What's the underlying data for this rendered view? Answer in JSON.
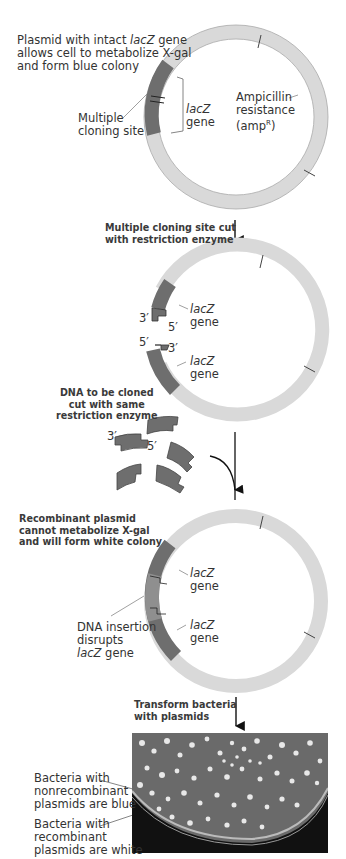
{
  "figure": {
    "panels": [
      {
        "id": "intact-plasmid",
        "caption": [
          "Plasmid with intact ",
          "lacZ",
          " gene",
          "allows cell to metabolize X-gal",
          "and form blue colony"
        ],
        "labels": {
          "mcs": [
            "Multiple",
            "cloning site"
          ],
          "lacz": [
            "lacZ",
            "gene"
          ],
          "ampr": [
            "Ampicillin",
            "resistance",
            "(amp",
            "R",
            ")"
          ]
        }
      },
      {
        "id": "cut-plasmid",
        "step_label": [
          "Multiple cloning site cut",
          "with restriction enzyme"
        ],
        "labels": {
          "upper_end": {
            "three": "3′",
            "five": "5′"
          },
          "lower_end": {
            "five": "5′",
            "three": "3′"
          },
          "lacz_upper": [
            "lacZ",
            "gene"
          ],
          "lacz_lower": [
            "lacZ",
            "gene"
          ]
        }
      },
      {
        "id": "donor-dna",
        "step_label": [
          "DNA to be cloned",
          "cut with same",
          "restriction enzyme"
        ],
        "labels": {
          "three": "3′",
          "five": "5′"
        }
      },
      {
        "id": "recombinant-plasmid",
        "step_label": [
          "Recombinant plasmid",
          "cannot metabolize X-gal",
          "and will form white colony"
        ],
        "labels": {
          "lacz_upper": [
            "lacZ",
            "gene"
          ],
          "lacz_lower": [
            "lacZ",
            "gene"
          ],
          "insertion": [
            "DNA insertion",
            "disrupts",
            "lacZ",
            " gene"
          ]
        }
      },
      {
        "id": "transformation",
        "step_label": [
          "Transform bacteria",
          "with plasmids"
        ],
        "labels": {
          "blue": [
            "Bacteria with",
            "nonrecombinant",
            "plasmids are blue"
          ],
          "white": [
            "Bacteria with",
            "recombinant",
            "plasmids are white"
          ]
        }
      }
    ],
    "colors": {
      "ring_light": "#d9d9d9",
      "ring_mid": "#c8c8c8",
      "lacz_dark": "#6e6e6e",
      "insert": "#8a8a8a",
      "outline": "#555555",
      "bold_text": "#3a3a3a",
      "dish_bg": "#6c6c6c"
    }
  }
}
